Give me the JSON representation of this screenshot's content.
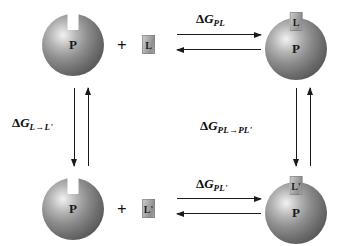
{
  "diagram": {
    "type": "thermodynamic-cycle",
    "species": {
      "protein_label": "P",
      "ligand_label": "L",
      "ligand_prime_label": "L'",
      "plus_sign": "+"
    },
    "colors": {
      "background": "#ffffff",
      "stroke": "#1a1a1a",
      "sphere_dark": "#454545",
      "sphere_light": "#f2f2f2",
      "ligand_fill": "#a5a5a5",
      "notch_fill": "#ffffff"
    },
    "states": [
      {
        "id": "top-left",
        "name": "free-protein-plus-ligand",
        "protein": "P",
        "ligand": "L",
        "bound": false
      },
      {
        "id": "top-right",
        "name": "protein-ligand-complex",
        "protein": "P",
        "ligand": "L",
        "bound": true
      },
      {
        "id": "bottom-left",
        "name": "free-protein-plus-ligand-prime",
        "protein": "P",
        "ligand": "L'",
        "bound": false
      },
      {
        "id": "bottom-right",
        "name": "protein-ligand-prime-complex",
        "protein": "P",
        "ligand": "L'",
        "bound": true
      }
    ],
    "reactions": [
      {
        "id": "top",
        "name": "binding-of-L",
        "orientation": "horizontal",
        "reversible": true,
        "delta": "Δ",
        "symbol": "G",
        "subscript": "PL",
        "label": "ΔG_PL"
      },
      {
        "id": "bottom",
        "name": "binding-of-L-prime",
        "orientation": "horizontal",
        "reversible": true,
        "delta": "Δ",
        "symbol": "G",
        "subscript": "PL'",
        "label": "ΔG_PL'"
      },
      {
        "id": "left",
        "name": "free-ligand-transformation",
        "orientation": "vertical",
        "reversible": true,
        "delta": "Δ",
        "symbol": "G",
        "subscript": "L→L'",
        "label": "ΔG_L→L'"
      },
      {
        "id": "right",
        "name": "bound-ligand-transformation",
        "orientation": "vertical",
        "reversible": true,
        "delta": "Δ",
        "symbol": "G",
        "subscript": "PL→PL'",
        "label": "ΔG_PL→PL'"
      }
    ]
  }
}
